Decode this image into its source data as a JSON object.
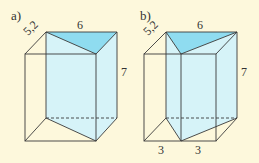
{
  "figures": [
    {
      "label": "a)",
      "top_edge_label": "6",
      "depth_edge_label": "5,2",
      "height_label": "7",
      "description": "Rectangular box containing a triangular prism with apex at the front-right edge"
    },
    {
      "label": "b)",
      "top_edge_label": "6",
      "depth_edge_label": "5,2",
      "height_label": "7",
      "bottom_labels": [
        "3",
        "3"
      ],
      "description": "Rectangular box containing a triangular prism with apex at the midpoint of the front edge"
    }
  ],
  "colors": {
    "background": "#fdf8dc",
    "prism_top": "#8fdcf0",
    "prism_side": "#d6f3f8",
    "line": "#3a3a3a"
  }
}
